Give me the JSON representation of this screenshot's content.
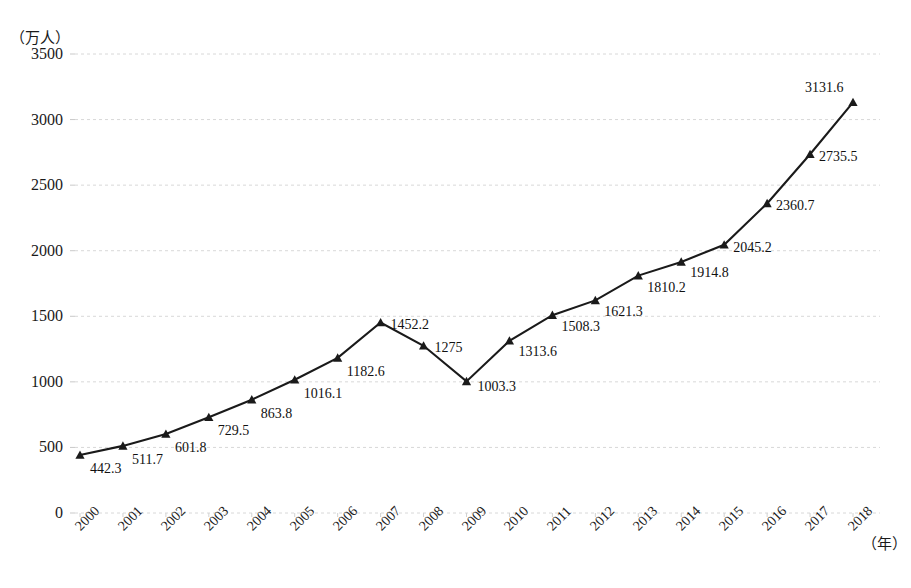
{
  "chart_data": {
    "type": "line",
    "title": "",
    "subtitle": "",
    "xlabel": "（年）",
    "ylabel": "（万人）",
    "categories": [
      "2000",
      "2001",
      "2002",
      "2003",
      "2004",
      "2005",
      "2006",
      "2007",
      "2008",
      "2009",
      "2010",
      "2011",
      "2012",
      "2013",
      "2014",
      "2015",
      "2016",
      "2017",
      "2018"
    ],
    "values": [
      442.3,
      511.7,
      601.8,
      729.5,
      863.8,
      1016.1,
      1182.6,
      1452.2,
      1275,
      1003.3,
      1313.6,
      1508.3,
      1621.3,
      1810.2,
      1914.8,
      2045.2,
      2360.7,
      2735.5,
      3131.6
    ],
    "point_labels": [
      "442.3",
      "511.7",
      "601.8",
      "729.5",
      "863.8",
      "1016.1",
      "1182.6",
      "1452.2",
      "1275",
      "1003.3",
      "1313.6",
      "1508.3",
      "1621.3",
      "1810.2",
      "1914.8",
      "2045.2",
      "2360.7",
      "2735.5",
      "3131.6"
    ],
    "ylim": [
      0,
      3500
    ],
    "yticks": [
      0,
      500,
      1000,
      1500,
      2000,
      2500,
      3000,
      3500
    ],
    "ytick_labels": [
      "0",
      "500",
      "1000",
      "1500",
      "2000",
      "2500",
      "3000",
      "3500"
    ],
    "grid": true,
    "legend": "none",
    "series_name": "",
    "marker": "triangle",
    "line_color": "#1a1a1a",
    "grid_color": "#d8d8d8"
  }
}
